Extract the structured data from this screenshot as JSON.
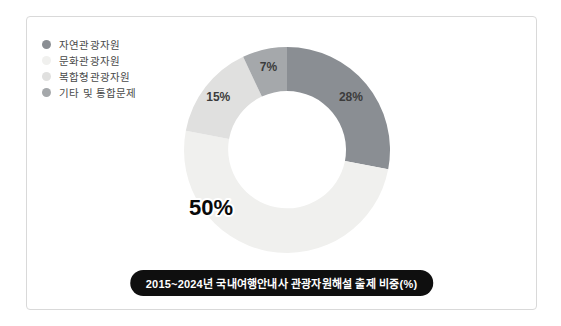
{
  "chart_data": {
    "type": "pie",
    "subtype": "donut",
    "title": "2015~2024년 국내여행안내사 관광자원해설 출제 비중(%)",
    "unit": "%",
    "categories": [
      "자연관광자원",
      "문화관광자원",
      "복합형관광자원",
      "기타 및 통합문제"
    ],
    "values": [
      28,
      50,
      15,
      7
    ],
    "labels": [
      "28%",
      "50%",
      "15%",
      "7%"
    ],
    "colors": [
      "#8a8e93",
      "#f0f0ee",
      "#e0e0df",
      "#a5a8ab"
    ],
    "start_angle_deg": 0,
    "direction": "clockwise",
    "hole_ratio": 0.57,
    "legend_position": "top-left",
    "label_angles_deg": [
      50.4,
      233,
      307.8,
      347.4
    ],
    "label_radii": [
      83,
      95,
      87,
      85
    ],
    "big_label_index": 1
  },
  "colors": {
    "card_border": "#d9d9d9",
    "pill_bg": "#0f0f0f",
    "pill_text": "#ffffff",
    "label_text": "#3c3c3c",
    "big_label_text": "#0a0a0a",
    "legend_text": "#4a4a4a"
  }
}
